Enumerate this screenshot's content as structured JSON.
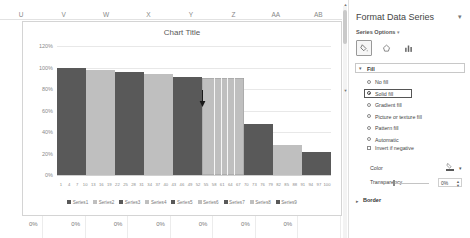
{
  "sheet": {
    "column_headers": [
      "U",
      "V",
      "W",
      "X",
      "Y",
      "Z",
      "AA",
      "AB"
    ],
    "bottom_row_values": [
      "0%",
      "0%",
      "0%",
      "0%",
      "0%",
      "0%",
      "0%"
    ]
  },
  "chart": {
    "title": "Chart Title",
    "cursor_icon": "down-arrow-cursor"
  },
  "chart_data": {
    "type": "bar",
    "title": "Chart Title",
    "xlabel": "",
    "ylabel": "",
    "ylim": [
      0,
      1.2
    ],
    "ytick_labels": [
      "120%",
      "100%",
      "80%",
      "60%",
      "40%",
      "20%",
      "0%"
    ],
    "ytick_values": [
      1.2,
      1.0,
      0.8,
      0.6,
      0.4,
      0.2,
      0.0
    ],
    "grid": true,
    "legend_position": "bottom",
    "x_tick_labels": [
      "1",
      "4",
      "7",
      "10",
      "13",
      "16",
      "19",
      "22",
      "25",
      "28",
      "31",
      "34",
      "37",
      "40",
      "43",
      "46",
      "49",
      "52",
      "55",
      "58",
      "61",
      "64",
      "67",
      "70",
      "73",
      "76",
      "79",
      "82",
      "85",
      "88",
      "91",
      "94",
      "97",
      "100"
    ],
    "series": [
      {
        "name": "Series1",
        "value": 1.0,
        "color": "#595959",
        "selected": false
      },
      {
        "name": "Series2",
        "value": 0.98,
        "color": "#bfbfbf",
        "selected": false
      },
      {
        "name": "Series3",
        "value": 0.955,
        "color": "#595959",
        "selected": false
      },
      {
        "name": "Series4",
        "value": 0.94,
        "color": "#bfbfbf",
        "selected": false
      },
      {
        "name": "Series5",
        "value": 0.915,
        "color": "#595959",
        "selected": false
      },
      {
        "name": "Series6",
        "value": 0.905,
        "color": "#bfbfbf",
        "selected": true
      },
      {
        "name": "Series7",
        "value": 0.475,
        "color": "#595959",
        "selected": false
      },
      {
        "name": "Series8",
        "value": 0.275,
        "color": "#bfbfbf",
        "selected": false
      },
      {
        "name": "Series9",
        "value": 0.215,
        "color": "#595959",
        "selected": false
      }
    ],
    "legend": [
      {
        "label": "Series1",
        "color": "#595959"
      },
      {
        "label": "Series2",
        "color": "#bfbfbf"
      },
      {
        "label": "Series3",
        "color": "#595959"
      },
      {
        "label": "Series4",
        "color": "#bfbfbf"
      },
      {
        "label": "Series5",
        "color": "#595959"
      },
      {
        "label": "Series6",
        "color": "#bfbfbf"
      },
      {
        "label": "Series7",
        "color": "#595959"
      },
      {
        "label": "Series8",
        "color": "#bfbfbf"
      },
      {
        "label": "Series9",
        "color": "#595959"
      }
    ]
  },
  "pane": {
    "title": "Format Data Series",
    "collapse_icon": "chevron-down-icon",
    "subtitle": "Series Options",
    "subtitle_caret": "chevron-down-icon",
    "tabs": [
      {
        "name": "fill-and-line-icon",
        "glyph": "fill",
        "active": true
      },
      {
        "name": "effects-icon",
        "glyph": "effects",
        "active": false
      },
      {
        "name": "series-options-icon",
        "glyph": "columns",
        "active": false
      }
    ],
    "fill_section": {
      "label": "Fill",
      "caret": "chevron-down-icon",
      "options": [
        {
          "label": "No fill",
          "selected": false
        },
        {
          "label": "Solid fill",
          "selected": true
        },
        {
          "label": "Gradient fill",
          "selected": false
        },
        {
          "label": "Picture or texture fill",
          "selected": false
        },
        {
          "label": "Pattern fill",
          "selected": false
        },
        {
          "label": "Automatic",
          "selected": false
        }
      ],
      "invert_if_negative": {
        "label": "Invert if negative",
        "checked": false
      },
      "color": {
        "label": "Color",
        "value": "#595959",
        "caret": "chevron-down-icon"
      },
      "transparency": {
        "label": "Transparency",
        "value": "0%"
      }
    },
    "border_section": {
      "label": "Border",
      "caret": "chevron-right-icon"
    }
  }
}
